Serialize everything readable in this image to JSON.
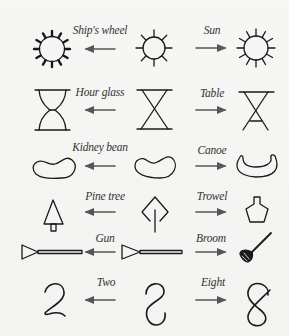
{
  "colors": {
    "background": "#f4f4f2",
    "stroke": "#1a1a1a",
    "arrow": "#555555",
    "label": "#333333"
  },
  "rows": [
    {
      "left_label": "Ship's wheel",
      "right_label": "Sun",
      "left_figure": "ships-wheel",
      "middle_figure": "sun-ambiguous",
      "right_figure": "sun"
    },
    {
      "left_label": "Hour glass",
      "right_label": "Table",
      "left_figure": "hour-glass",
      "middle_figure": "x-shape-ambiguous",
      "right_figure": "table"
    },
    {
      "left_label": "Kidney bean",
      "right_label": "Canoe",
      "left_figure": "kidney-bean",
      "middle_figure": "bean-ambiguous",
      "right_figure": "canoe"
    },
    {
      "left_label": "Pine tree",
      "right_label": "Trowel",
      "left_figure": "pine-tree",
      "middle_figure": "diamond-ambiguous",
      "right_figure": "trowel"
    },
    {
      "left_label": "Gun",
      "right_label": "Broom",
      "left_figure": "gun",
      "middle_figure": "gun-ambiguous",
      "right_figure": "broom"
    },
    {
      "left_label": "Two",
      "right_label": "Eight",
      "left_figure": "two",
      "middle_figure": "s-curve-ambiguous",
      "right_figure": "eight"
    }
  ]
}
